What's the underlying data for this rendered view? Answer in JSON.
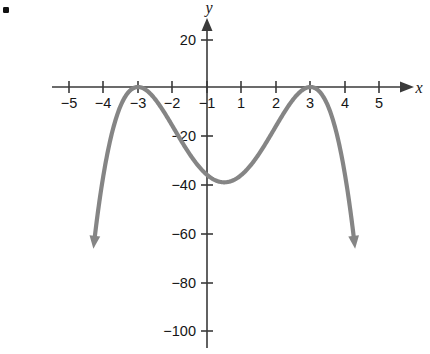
{
  "figure": {
    "bullet_marker": "•",
    "background_color": "#ffffff"
  },
  "chart_data": {
    "type": "line",
    "title": "",
    "subtitle": "",
    "xlabel": "x",
    "ylabel": "y",
    "curve_color": "#858585",
    "axis_color": "#3a3a3a",
    "grid": false,
    "legend": null,
    "xlim": [
      -5.6,
      5.6
    ],
    "ylim": [
      -104,
      24
    ],
    "x_ticks": [
      -5,
      -4,
      -3,
      -2,
      -1,
      1,
      2,
      3,
      4,
      5
    ],
    "x_tick_labels": [
      "−5",
      "−4",
      "−3",
      "−2",
      "−1",
      "1",
      "2",
      "3",
      "4",
      "5"
    ],
    "y_ticks": [
      20,
      -20,
      -40,
      -60,
      -80,
      -100
    ],
    "y_tick_labels": [
      "20",
      "−20",
      "−40",
      "−60",
      "−80",
      "−100"
    ],
    "function_expression": "y = −(x + 2)²(x − 3)²",
    "series": [
      {
        "name": "quartic",
        "x": [
          -3.25,
          -3.2,
          -3.1,
          -3.0,
          -2.9,
          -2.8,
          -2.7,
          -2.6,
          -2.5,
          -2.4,
          -2.3,
          -2.2,
          -2.1,
          -2.0,
          -1.9,
          -1.8,
          -1.7,
          -1.6,
          -1.5,
          -1.4,
          -1.3,
          -1.2,
          -1.1,
          -1.0,
          -0.9,
          -0.8,
          -0.7,
          -0.6,
          -0.5,
          -0.4,
          -0.3,
          -0.2,
          -0.1,
          0.0,
          0.1,
          0.2,
          0.3,
          0.4,
          0.5,
          0.6,
          0.7,
          0.8,
          0.9,
          1.0,
          1.1,
          1.2,
          1.3,
          1.4,
          1.5,
          1.6,
          1.7,
          1.8,
          1.9,
          2.0,
          2.1,
          2.2,
          2.3,
          2.4,
          2.5,
          2.6,
          2.7,
          2.8,
          2.9,
          3.0,
          3.1,
          3.2,
          3.3,
          3.4,
          3.5,
          3.6,
          3.7,
          3.8,
          3.9,
          4.0,
          4.1,
          4.2,
          4.25
        ],
        "y": [
          -97.52,
          -92.16,
          -82.08,
          -72.0,
          -62.41,
          -53.3,
          -44.65,
          -36.46,
          -28.73,
          -21.46,
          -14.67,
          -8.35,
          -2.54,
          0.0,
          -2.4,
          -4.61,
          -6.63,
          -8.47,
          -10.13,
          -11.63,
          -12.96,
          -14.14,
          -15.18,
          -16.0,
          -16.81,
          -17.47,
          -18.0,
          -18.41,
          -18.7,
          -18.9,
          -19.0,
          -19.03,
          -18.98,
          -36.0,
          -18.71,
          -18.49,
          -18.23,
          -17.93,
          -17.6,
          -17.23,
          -16.84,
          -16.42,
          -15.99,
          -15.53,
          -15.06,
          -14.58,
          -14.09,
          -13.58,
          -13.08,
          -12.57,
          -12.06,
          -11.55,
          -11.04,
          -10.54,
          -10.04,
          -9.55,
          -9.07,
          -8.6,
          -8.14,
          -7.69,
          -7.26,
          -6.84,
          -6.44,
          0.0,
          -6.43,
          -6.65,
          -7.73,
          -9.77,
          -12.86,
          -17.1,
          -22.58,
          -29.4,
          -37.65,
          -47.43,
          -58.83,
          -71.95,
          -79.17
        ]
      }
    ],
    "annotations": [
      {
        "name": "left-peak",
        "x": -2,
        "y": 0,
        "note": "double root at x = −2, curve touches x-axis"
      },
      {
        "name": "right-peak",
        "x": 3,
        "y": 0,
        "note": "double root at x = 3, curve touches x-axis"
      },
      {
        "name": "local-minimum",
        "x": 0.5,
        "y": -39,
        "note": "local minimum near y = −39"
      },
      {
        "name": "left-arrow",
        "note": "curve descends off-chart to the lower left"
      },
      {
        "name": "right-arrow",
        "note": "curve descends off-chart to the lower right"
      }
    ]
  }
}
